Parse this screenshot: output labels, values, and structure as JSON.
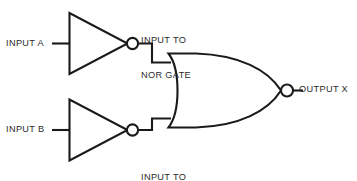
{
  "diagram": {
    "type": "logic-circuit-schematic",
    "background_color": "#ffffff",
    "line_color": "#1a1a1a",
    "text_color": "#2b2b2b",
    "labels": {
      "input_a": "INPUT A",
      "input_b": "INPUT B",
      "nor_input_top_line1": "INPUT TO",
      "nor_input_top_line2": "NOR GATE",
      "nor_input_bottom_line1": "INPUT TO",
      "nor_input_bottom_line2": "NOR GATE",
      "output_x": "OUTPUT X"
    },
    "components": [
      {
        "name": "inverter-top",
        "type": "NOT gate",
        "input_label": "INPUT A",
        "output_label": "INPUT TO NOR GATE"
      },
      {
        "name": "inverter-bottom",
        "type": "NOT gate",
        "input_label": "INPUT B",
        "output_label": "INPUT TO NOR GATE"
      },
      {
        "name": "nor-gate",
        "type": "NOR gate",
        "inputs": 2,
        "output_label": "OUTPUT X"
      }
    ]
  }
}
